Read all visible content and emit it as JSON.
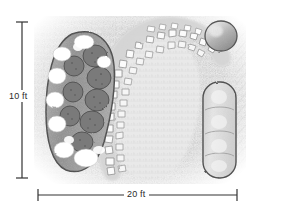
{
  "drawing": {
    "title": "Garden Landscape Plan",
    "medium": "pencil sketch",
    "background_color": "#ffffff",
    "paper_tone": "#f2f2f2"
  },
  "dimensions": {
    "vertical": {
      "label": "10 ft",
      "value": 10,
      "unit": "ft",
      "orientation": "vertical",
      "line_color": "#333333",
      "endcaps": "tick"
    },
    "horizontal": {
      "label": "20 ft",
      "value": 20,
      "unit": "ft",
      "orientation": "horizontal",
      "line_color": "#333333",
      "endcaps": "tick"
    }
  },
  "features": [
    {
      "name": "kidney-planting-bed",
      "description": "Large crescent / kidney shaped planting bed with dark shrub masses and light flowering clusters",
      "fill": "#9a9a9a",
      "outline": "#4a4a4a"
    },
    {
      "name": "cobblestone-path",
      "description": "Curving irregular flagstone path arcing around the lawn",
      "fill": "#ffffff",
      "outline": "#8d8d8d"
    },
    {
      "name": "lawn-area",
      "description": "Open turf area enclosed by the stone path",
      "fill": "#e9e9e9"
    },
    {
      "name": "round-shrub",
      "description": "Round specimen shrub at upper right corner",
      "fill": "#b8b8b8",
      "outline": "#5a5a5a"
    },
    {
      "name": "rounded-rectangle-bed",
      "description": "Tall rounded rectangular foundation planting bed with lobed segments",
      "fill": "#dcdcdc",
      "outline": "#4f4f4f"
    },
    {
      "name": "house-wall",
      "description": "Building edge at right with diagonal hatching",
      "outline": "#777777"
    },
    {
      "name": "grass-texture",
      "description": "Soft pencil grass texture filling the yard"
    }
  ],
  "colors": {
    "ink_dark": "#333333",
    "graphite_mid": "#8c8c8c",
    "graphite_light": "#d6d6d6",
    "shrub_dark": "#6e6e6e",
    "flower_light": "#ffffff"
  }
}
